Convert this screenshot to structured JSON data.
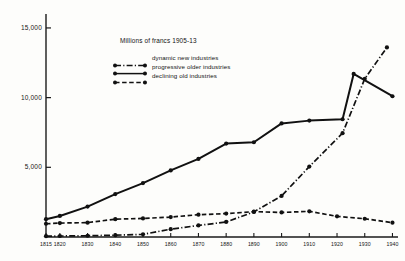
{
  "chart_data": {
    "type": "line",
    "title": "Millions of francs 1905-13",
    "xlabel": "",
    "ylabel": "",
    "xlim": [
      1815,
      1942
    ],
    "ylim": [
      0,
      16000
    ],
    "grid": false,
    "legend_position": "upper-left-inside",
    "y_ticks": [
      5000,
      10000,
      15000
    ],
    "y_tick_labels": [
      "5,000",
      "10,000",
      "15,000"
    ],
    "x_ticks": [
      1815,
      1820,
      1830,
      1840,
      1850,
      1860,
      1870,
      1880,
      1890,
      1900,
      1910,
      1920,
      1930,
      1940
    ],
    "x_tick_labels": [
      "1815",
      "1820",
      "1830",
      "1840",
      "1850",
      "1860",
      "1870",
      "1880",
      "1890",
      "1900",
      "1910",
      "1920",
      "1930",
      "1940"
    ],
    "series": [
      {
        "name": "dynamic new industries",
        "style": "dash-dot",
        "marker": "filled-circle",
        "x": [
          1815,
          1820,
          1830,
          1840,
          1850,
          1860,
          1870,
          1880,
          1890,
          1900,
          1910,
          1922,
          1930,
          1938
        ],
        "values": [
          60,
          70,
          90,
          130,
          190,
          560,
          830,
          1080,
          1800,
          2950,
          5050,
          7450,
          11350,
          13600
        ]
      },
      {
        "name": "progressive older industries",
        "style": "solid",
        "marker": "filled-circle",
        "x": [
          1815,
          1820,
          1830,
          1840,
          1850,
          1860,
          1870,
          1880,
          1890,
          1900,
          1910,
          1922,
          1926,
          1940
        ],
        "values": [
          1280,
          1510,
          2180,
          3080,
          3870,
          4780,
          5600,
          6700,
          6800,
          8150,
          8350,
          8450,
          11700,
          10100
        ]
      },
      {
        "name": "declining old industries",
        "style": "dashed",
        "marker": "filled-circle",
        "x": [
          1815,
          1820,
          1830,
          1840,
          1850,
          1860,
          1870,
          1880,
          1890,
          1900,
          1910,
          1920,
          1930,
          1940
        ],
        "values": [
          950,
          1000,
          1030,
          1280,
          1330,
          1430,
          1600,
          1680,
          1820,
          1760,
          1840,
          1480,
          1310,
          1030
        ]
      }
    ]
  },
  "axes": {
    "y_axis_name": "value-axis",
    "x_axis_name": "year-axis"
  }
}
